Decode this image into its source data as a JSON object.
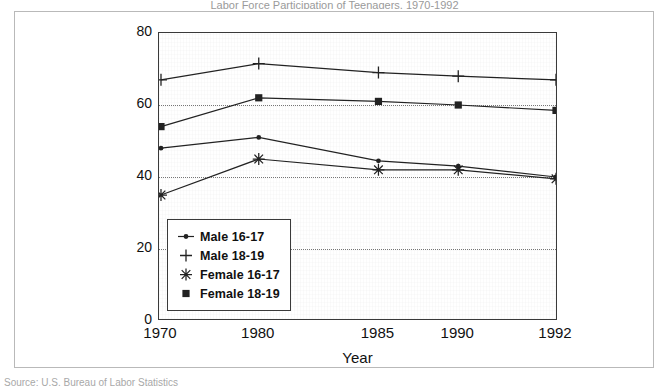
{
  "figure": {
    "title_clipped": "Labor Force Participation of Teenagers, 1970-1992",
    "source_clipped": "Source: U.S. Bureau of Labor Statistics"
  },
  "chart_data": {
    "type": "line",
    "title": "Labor Force Participation of Teenagers, 1970-1992",
    "xlabel": "Year",
    "ylabel": "% in labor force",
    "categories": [
      "1970",
      "1980",
      "1985",
      "1990",
      "1992"
    ],
    "x_tick_labels": [
      "1970",
      "1980",
      "1985",
      "1990",
      "1992"
    ],
    "x_tick_positions_pct": [
      0.5,
      25.0,
      55.0,
      75.0,
      99.5
    ],
    "y_tick_labels": [
      "0",
      "20",
      "40",
      "60",
      "80"
    ],
    "y_tick_values": [
      0,
      20,
      40,
      60,
      80
    ],
    "ylim": [
      0,
      80
    ],
    "grid": "horizontal-dotted",
    "legend_position": "bottom-left-inside",
    "series": [
      {
        "name": "Male 16-17",
        "marker": "dot",
        "values": [
          48,
          51,
          44.5,
          43,
          40
        ]
      },
      {
        "name": "Male 18-19",
        "marker": "plus",
        "values": [
          67,
          71.5,
          69,
          68,
          67
        ]
      },
      {
        "name": "Female 16-17",
        "marker": "asterisk",
        "values": [
          35,
          45,
          42,
          42,
          39.5
        ]
      },
      {
        "name": "Female 18-19",
        "marker": "square",
        "values": [
          54,
          62,
          61,
          60,
          58.5
        ]
      }
    ]
  },
  "legend": {
    "items": [
      {
        "label": "Male 16-17",
        "marker": "dot"
      },
      {
        "label": "Male 18-19",
        "marker": "plus"
      },
      {
        "label": "Female 16-17",
        "marker": "asterisk"
      },
      {
        "label": "Female 18-19",
        "marker": "square"
      }
    ]
  },
  "colors": {
    "line": "#222222",
    "axis": "#3a3a3a",
    "grid": "#777777",
    "background": "#ffffff"
  }
}
